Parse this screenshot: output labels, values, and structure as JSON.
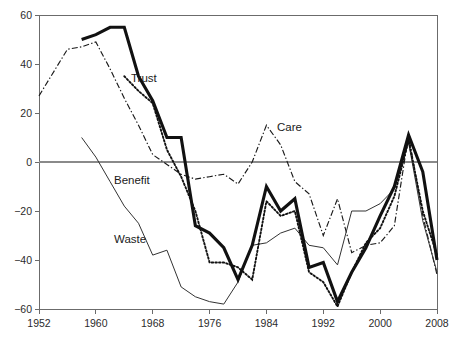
{
  "figure": {
    "title": "",
    "background_color": "#ffffff",
    "axis_color": "#6b6b6b",
    "frame": {
      "left": 39,
      "right": 437,
      "top": 15,
      "bottom": 309
    }
  },
  "labels": {
    "trust": "Trust",
    "care": "Care",
    "benefit": "Benefit",
    "waste": "Waste"
  },
  "label_positions": {
    "trust": {
      "x": 131,
      "y": 82
    },
    "care": {
      "x": 277,
      "y": 131
    },
    "benefit": {
      "x": 114,
      "y": 184
    },
    "waste": {
      "x": 114,
      "y": 243
    }
  },
  "chart_data": {
    "type": "line",
    "title": "",
    "xlabel": "",
    "ylabel": "",
    "xlim": [
      1952,
      2008
    ],
    "ylim": [
      -60,
      60
    ],
    "xticks": [
      1952,
      1960,
      1968,
      1976,
      1984,
      1992,
      2000,
      2008
    ],
    "xtick_labels": [
      "1952",
      "1960",
      "1968",
      "1976",
      "1984",
      "1992",
      "2000",
      "2008"
    ],
    "yticks": [
      -60,
      -40,
      -20,
      0,
      20,
      40,
      60
    ],
    "ytick_labels": [
      "−60",
      "−40",
      "−20",
      "0",
      "20",
      "40",
      "60"
    ],
    "grid": false,
    "legend": "inline-annotations",
    "zero_line": true,
    "series": [
      {
        "name": "Trust",
        "style": "thick-solid",
        "color": "#111111",
        "x": [
          1958,
          1960,
          1962,
          1964,
          1966,
          1968,
          1970,
          1972,
          1974,
          1976,
          1978,
          1980,
          1982,
          1984,
          1986,
          1988,
          1990,
          1992,
          1994,
          1996,
          1998,
          2000,
          2002,
          2004,
          2006,
          2008
        ],
        "values": [
          50,
          52,
          55,
          55,
          35,
          25,
          10,
          10,
          -26,
          -29,
          -35,
          -48,
          -34,
          -10,
          -20,
          -15,
          -43,
          -41,
          -57,
          -45,
          -35,
          -22,
          -10,
          11,
          -4,
          -40
        ]
      },
      {
        "name": "Care",
        "style": "dash-dot",
        "color": "#1a1a1a",
        "x": [
          1952,
          1956,
          1958,
          1960,
          1962,
          1964,
          1966,
          1968,
          1970,
          1972,
          1974,
          1976,
          1978,
          1980,
          1982,
          1984,
          1986,
          1988,
          1990,
          1992,
          1994,
          1996,
          1998,
          2000,
          2002,
          2004,
          2006,
          2008
        ],
        "values": [
          27,
          46,
          47,
          49,
          38,
          26,
          15,
          3,
          -1,
          -5,
          -7,
          -6,
          -5,
          -9,
          0,
          15,
          7,
          -8,
          -13,
          -30,
          -15,
          -37,
          -34,
          -33,
          -26,
          11,
          -22,
          -46
        ]
      },
      {
        "name": "Benefit",
        "style": "dotted",
        "color": "#111111",
        "x": [
          1964,
          1966,
          1968,
          1970,
          1972,
          1974,
          1976,
          1978,
          1980,
          1982,
          1984,
          1986,
          1988,
          1990,
          1992,
          1994,
          1996,
          1998,
          2000,
          2002,
          2004,
          2006,
          2008
        ],
        "values": [
          35,
          29,
          24,
          5,
          -6,
          -20,
          -41,
          -41,
          -43,
          -48,
          -16,
          -22,
          -20,
          -45,
          -49,
          -59,
          -45,
          -33,
          -27,
          -14,
          9,
          -20,
          -38
        ]
      },
      {
        "name": "Waste",
        "style": "thin-solid",
        "color": "#333333",
        "x": [
          1958,
          1960,
          1962,
          1964,
          1966,
          1968,
          1970,
          1972,
          1974,
          1976,
          1978,
          1980,
          1982,
          1984,
          1986,
          1988,
          1990,
          1992,
          1994,
          1996,
          1998,
          2000,
          2002,
          2004,
          2006,
          2008
        ],
        "values": [
          10,
          2,
          -8,
          -18,
          -25,
          -38,
          -36,
          -51,
          -55,
          -57,
          -58,
          -49,
          -34,
          -33,
          -29,
          -27,
          -34,
          -35,
          -42,
          -20,
          -20,
          -17,
          -11,
          8,
          -24,
          -45
        ]
      }
    ]
  }
}
